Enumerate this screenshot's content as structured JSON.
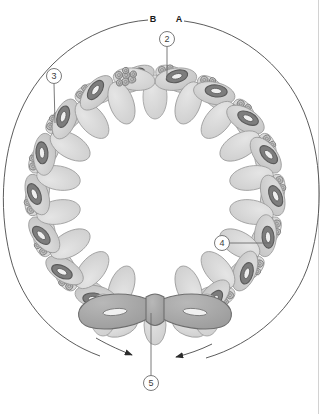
{
  "figure": {
    "background_color": "#ffffff",
    "border_color": "#d2d2d2",
    "geometry": {
      "center_x": 155,
      "center_y": 195,
      "ring_radius": 118,
      "subunit_count": 18,
      "outer_arc_radius": 152
    },
    "palette": {
      "lobe_fill": "#cfcfcf",
      "lobe_fill_light": "#d8d8d8",
      "lobe_stroke": "#9a9a9a",
      "torus_fill": "#7d7d7d",
      "torus_stroke": "#5a5a5a",
      "bead_fill": "#b4b4b4",
      "bead_stroke": "#7a7a7a",
      "highlight_fill": "#a9a9a9",
      "highlight_stroke": "#6e6e6e",
      "arc_stroke": "#4a4a4a",
      "callout_stroke": "#6b6b6b",
      "label_text": "#1a1a1a"
    }
  },
  "letter_labels": [
    {
      "id": "label-b",
      "text": "B",
      "x": 153,
      "y": 22
    },
    {
      "id": "label-a",
      "text": "A",
      "x": 179,
      "y": 22
    }
  ],
  "callouts": [
    {
      "id": "callout-2",
      "number": "2",
      "circle_x": 167,
      "circle_y": 39,
      "circle_r": 7.5,
      "line_x1": 167,
      "line_y1": 46.5,
      "line_x2": 167,
      "line_y2": 78,
      "target": "lobe-domain"
    },
    {
      "id": "callout-3",
      "number": "3",
      "circle_x": 54,
      "circle_y": 76,
      "circle_r": 7.5,
      "line_x1": 54,
      "line_y1": 83.5,
      "line_x2": 55,
      "line_y2": 123,
      "target": "torus-ring"
    },
    {
      "id": "callout-4",
      "number": "4",
      "circle_x": 222,
      "circle_y": 243,
      "circle_r": 7.5,
      "line_x1": 229.5,
      "line_y1": 243,
      "line_x2": 271,
      "line_y2": 243,
      "target": "bead-cluster"
    },
    {
      "id": "callout-5",
      "number": "5",
      "circle_x": 151,
      "circle_y": 383,
      "circle_r": 7.5,
      "line_x1": 151,
      "line_y1": 375.5,
      "line_x2": 151,
      "line_y2": 313,
      "target": "highlighted-subunit"
    }
  ],
  "arrows": [
    {
      "id": "arc-arrow-b",
      "label": "B",
      "direction": "clockwise",
      "head_x": 134,
      "head_y": 353,
      "head_angle": 25
    },
    {
      "id": "arc-arrow-a",
      "label": "A",
      "direction": "counterclockwise",
      "head_x": 172,
      "head_y": 356,
      "head_angle": 205
    }
  ]
}
